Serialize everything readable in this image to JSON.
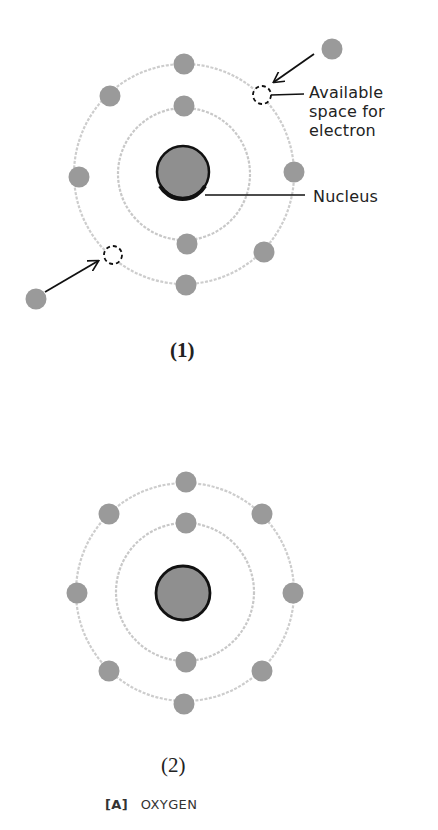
{
  "figure1": {
    "caption": "(1)",
    "label_available": [
      "Available",
      "space for",
      "electron"
    ],
    "label_nucleus": "Nucleus"
  },
  "figure2": {
    "caption": "(2)"
  },
  "footer": {
    "tag": "[A]",
    "title": "OXYGEN"
  },
  "colors": {
    "electron": "#9a9a9a",
    "nucleus_fill": "#8f8f8f",
    "nucleus_border": "#111111",
    "orbit": "#c8c8c8",
    "arrow": "#111111"
  }
}
